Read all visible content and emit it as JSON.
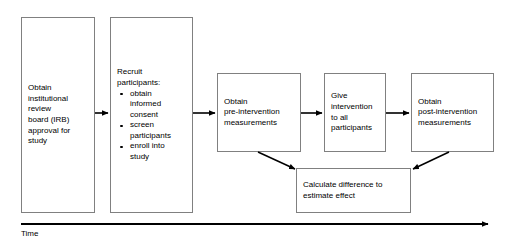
{
  "diagram": {
    "stroke_color": "#808080",
    "arrow_color": "#000000",
    "text_color": "#000000",
    "background": "#ffffff"
  },
  "nodes": {
    "irb": {
      "label": "Obtain\ninstitutional\nreview\nboard (IRB)\napproval for\nstudy"
    },
    "recruit": {
      "heading": "Recruit\nparticipants:",
      "bullets": [
        "obtain\ninformed\nconsent",
        "screen\nparticipants",
        "enroll into\nstudy"
      ]
    },
    "pre": {
      "label": "Obtain\npre-intervention\nmeasurements"
    },
    "give": {
      "label": "Give\nintervention\nto all\nparticipants"
    },
    "post": {
      "label": "Obtain\npost-intervention\nmeasurements"
    },
    "calculate": {
      "label": "Calculate difference to\nestimate effect"
    }
  },
  "axis": {
    "label": "Time"
  }
}
